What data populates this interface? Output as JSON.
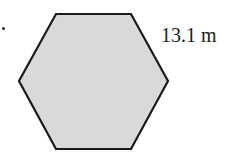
{
  "diagram": {
    "shape": "regular-hexagon",
    "side_label": "13.1 m",
    "fill_color": "#d9d9d9",
    "stroke_color": "#1a1a1a",
    "vertices": [
      [
        56,
        14
      ],
      [
        131,
        14
      ],
      [
        168,
        81
      ],
      [
        131,
        149
      ],
      [
        56,
        149
      ],
      [
        19,
        81
      ]
    ]
  }
}
